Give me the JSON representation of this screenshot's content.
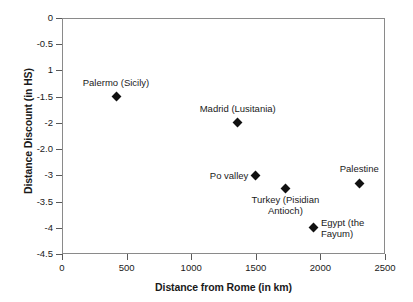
{
  "chart_data": {
    "type": "scatter",
    "title": "",
    "xlabel": "Distance from Rome (in km)",
    "ylabel": "Distance Discount (in HS)",
    "xlim": [
      0,
      2500
    ],
    "ylim": [
      -4.5,
      0
    ],
    "grid": false,
    "legend": "none",
    "x_ticks": [
      0,
      500,
      1000,
      1500,
      2000,
      2500
    ],
    "x_tick_labels": [
      "0",
      "500",
      "1000",
      "1500",
      "2000",
      "2500"
    ],
    "y_ticks": [
      0,
      -0.5,
      -1,
      -1.5,
      -2,
      -2.5,
      -3,
      -3.5,
      -4,
      -4.5
    ],
    "y_tick_labels": [
      "0",
      "-0.5",
      "1",
      "-1.5",
      "-2",
      "-2.0",
      "-3",
      "-3.5",
      "-4",
      "-4.5"
    ],
    "points": [
      {
        "label": "Palermo (Sicily)",
        "x": 420,
        "y": -1.5,
        "label_align": "center",
        "label_dx": 0,
        "label_dy": -15
      },
      {
        "label": "Madrid (Lusitania)",
        "x": 1360,
        "y": -2.0,
        "label_align": "center",
        "label_dx": 0,
        "label_dy": -15
      },
      {
        "label": "Po valley",
        "x": 1500,
        "y": -3.0,
        "label_align": "right",
        "label_dx": -7,
        "label_dy": -5
      },
      {
        "label": "Turkey (Pisidian\nAntioch)",
        "x": 1730,
        "y": -3.25,
        "label_align": "center",
        "label_dx": 0,
        "label_dy": 6
      },
      {
        "label": "Egypt (the\nFayum)",
        "x": 1950,
        "y": -4.0,
        "label_align": "left",
        "label_dx": 7,
        "label_dy": -5
      },
      {
        "label": "Palestine",
        "x": 2300,
        "y": -3.15,
        "label_align": "center",
        "label_dx": 0,
        "label_dy": -15
      }
    ],
    "marker_color": "#111111",
    "marker_shape": "diamond",
    "axis_color": "#8a8a8a"
  }
}
